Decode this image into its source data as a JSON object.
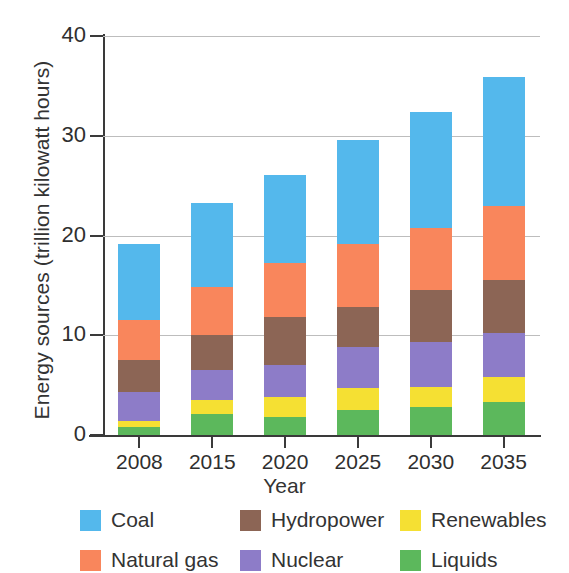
{
  "chart_data": {
    "type": "bar",
    "stacked": true,
    "title": "",
    "xlabel": "Year",
    "ylabel": "Energy sources (trillion kilowatt hours)",
    "categories": [
      "2008",
      "2015",
      "2020",
      "2025",
      "2030",
      "2035"
    ],
    "ylim": [
      0,
      40
    ],
    "yticks": [
      0,
      10,
      20,
      30,
      40
    ],
    "ytick_labels": [
      "0",
      "10",
      "20",
      "30",
      "40"
    ],
    "grid": true,
    "legend_position": "bottom",
    "stack_order_bottom_to_top": [
      "Liquids",
      "Renewables",
      "Nuclear",
      "Hydropower",
      "Natural gas",
      "Coal"
    ],
    "series": [
      {
        "name": "Coal",
        "color": "#54b8ec",
        "values": [
          7.7,
          8.5,
          8.9,
          10.4,
          11.6,
          12.9
        ]
      },
      {
        "name": "Natural gas",
        "color": "#f9865c",
        "values": [
          4.0,
          4.8,
          5.4,
          6.4,
          6.3,
          7.5
        ]
      },
      {
        "name": "Hydropower",
        "color": "#8c6555",
        "values": [
          3.2,
          3.5,
          4.8,
          4.0,
          5.2,
          5.3
        ]
      },
      {
        "name": "Nuclear",
        "color": "#8d7cc8",
        "values": [
          2.9,
          3.0,
          3.2,
          4.1,
          4.5,
          4.4
        ]
      },
      {
        "name": "Renewables",
        "color": "#f5e033",
        "values": [
          0.6,
          1.4,
          2.0,
          2.2,
          2.0,
          2.5
        ]
      },
      {
        "name": "Liquids",
        "color": "#5cb85c",
        "values": [
          0.8,
          2.1,
          1.8,
          2.5,
          2.8,
          3.3
        ]
      }
    ],
    "totals": [
      19.2,
      23.3,
      26.1,
      29.6,
      32.4,
      35.9
    ],
    "legend_entries": [
      {
        "label": "Coal",
        "color": "#54b8ec"
      },
      {
        "label": "Hydropower",
        "color": "#8c6555"
      },
      {
        "label": "Renewables",
        "color": "#f5e033"
      },
      {
        "label": "Natural gas",
        "color": "#f9865c"
      },
      {
        "label": "Nuclear",
        "color": "#8d7cc8"
      },
      {
        "label": "Liquids",
        "color": "#5cb85c"
      }
    ]
  },
  "axes": {
    "y_title": "Energy sources (trillion kilowatt hours)",
    "x_title": "Year"
  },
  "colors": {
    "coal": "#54b8ec",
    "natural_gas": "#f9865c",
    "hydropower": "#8c6555",
    "nuclear": "#8d7cc8",
    "renewables": "#f5e033",
    "liquids": "#5cb85c",
    "axis": "#3a3a3a",
    "grid": "#bdbdbd",
    "background": "#ffffff"
  }
}
